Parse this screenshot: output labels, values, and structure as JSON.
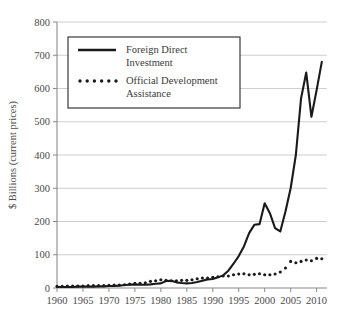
{
  "chart_data": {
    "type": "line",
    "title": "",
    "xlabel": "",
    "ylabel": "$ Billions (current prices)",
    "xlim": [
      1960,
      2012
    ],
    "ylim": [
      0,
      800
    ],
    "grid": true,
    "legend_position": "top-left",
    "y_ticks": [
      0,
      100,
      200,
      300,
      400,
      500,
      600,
      700,
      800
    ],
    "y_tick_labels": [
      "0",
      "100",
      "200",
      "300",
      "400",
      "500",
      "600",
      "700",
      "800"
    ],
    "x_ticks": [
      1960,
      1965,
      1970,
      1975,
      1980,
      1985,
      1990,
      1995,
      2000,
      2005,
      2010
    ],
    "x_tick_labels": [
      "1960",
      "1965",
      "1970",
      "1975",
      "1980",
      "1985",
      "1990",
      "1995",
      "2000",
      "2005",
      "2010"
    ],
    "x": [
      1960,
      1961,
      1962,
      1963,
      1964,
      1965,
      1966,
      1967,
      1968,
      1969,
      1970,
      1971,
      1972,
      1973,
      1974,
      1975,
      1976,
      1977,
      1978,
      1979,
      1980,
      1981,
      1982,
      1983,
      1984,
      1985,
      1986,
      1987,
      1988,
      1989,
      1990,
      1991,
      1992,
      1993,
      1994,
      1995,
      1996,
      1997,
      1998,
      1999,
      2000,
      2001,
      2002,
      2003,
      2004,
      2005,
      2006,
      2007,
      2008,
      2009,
      2010,
      2011
    ],
    "series": [
      {
        "name": "Foreign Direct Investment",
        "style": "solid",
        "color": "#1a1a1a",
        "values": [
          3,
          3,
          3,
          3,
          4,
          4,
          4,
          4,
          5,
          5,
          6,
          6,
          7,
          9,
          10,
          11,
          10,
          10,
          11,
          13,
          14,
          21,
          22,
          17,
          15,
          14,
          15,
          18,
          22,
          26,
          27,
          32,
          38,
          52,
          73,
          96,
          125,
          165,
          190,
          192,
          255,
          225,
          180,
          170,
          230,
          300,
          400,
          570,
          648,
          515,
          595,
          680
        ]
      },
      {
        "name": "Official Development Assistance",
        "style": "dotted",
        "color": "#1a1a1a",
        "values": [
          5,
          5,
          6,
          6,
          6,
          6,
          7,
          7,
          7,
          7,
          8,
          9,
          9,
          10,
          12,
          14,
          14,
          16,
          20,
          22,
          25,
          23,
          22,
          22,
          23,
          23,
          25,
          28,
          30,
          30,
          32,
          34,
          36,
          36,
          40,
          42,
          43,
          40,
          41,
          43,
          40,
          40,
          42,
          48,
          60,
          80,
          76,
          80,
          84,
          82,
          89,
          88
        ]
      }
    ]
  },
  "legend": {
    "items": [
      {
        "label_line1": "Foreign Direct",
        "label_line2": "Investment",
        "style": "solid"
      },
      {
        "label_line1": "Official Development",
        "label_line2": "Assistance",
        "style": "dotted"
      }
    ]
  },
  "colors": {
    "background": "#ffffff",
    "grid": "#c8c8c8",
    "axis": "#8a8a8a",
    "line": "#1a1a1a",
    "text": "#4a4a4a",
    "legend_border": "#3a3a3a"
  }
}
